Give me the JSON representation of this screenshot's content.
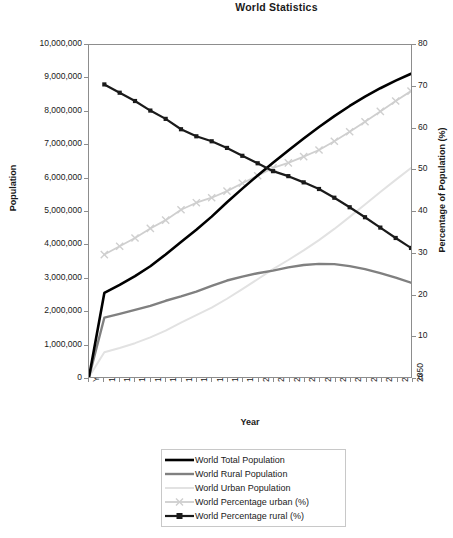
{
  "chart_title": "World Statistics",
  "axes": {
    "x_title": "Year",
    "y_left_title": "Population",
    "y_right_title": "Percentage of Population (%)",
    "y_left_ticks": [
      "10,000,000",
      "9,000,000",
      "8,000,000",
      "7,000,000",
      "6,000,000",
      "5,000,000",
      "4,000,000",
      "3,000,000",
      "2,000,000",
      "1,000,000",
      "0"
    ],
    "y_right_ticks": [
      "80",
      "70",
      "60",
      "50",
      "40",
      "30",
      "20",
      "10",
      "0"
    ],
    "x_ticks": [
      "Year",
      "1950",
      "1955",
      "1960",
      "1965",
      "1970",
      "1975",
      "1980",
      "1985",
      "1990",
      "1995",
      "2000",
      "2005",
      "2010",
      "2015",
      "2020",
      "2025",
      "2030",
      "2035",
      "2040",
      "2045",
      "2050"
    ]
  },
  "legend": {
    "items": [
      {
        "label": "World Total Population",
        "color": "#000000",
        "marker": "none",
        "width": 2.6
      },
      {
        "label": "World Rural Population",
        "color": "#808080",
        "marker": "none",
        "width": 2.4
      },
      {
        "label": "World Urban Population",
        "color": "#e2e2e2",
        "marker": "none",
        "width": 2.0
      },
      {
        "label": "World Percentage urban (%)",
        "color": "#cfcfcf",
        "marker": "cross",
        "width": 1.8
      },
      {
        "label": "World Percentage rural (%)",
        "color": "#1a1a1a",
        "marker": "square",
        "width": 2.2
      }
    ]
  },
  "chart_data": {
    "type": "line",
    "title": "World Statistics",
    "xlabel": "Year",
    "ylabel": "Population",
    "y2label": "Percentage of Population (%)",
    "ylim": [
      0,
      10000000
    ],
    "y2lim": [
      0,
      80
    ],
    "grid": false,
    "legend_position": "bottom",
    "categories": [
      "Year",
      "1950",
      "1955",
      "1960",
      "1965",
      "1970",
      "1975",
      "1980",
      "1985",
      "1990",
      "1995",
      "2000",
      "2005",
      "2010",
      "2015",
      "2020",
      "2025",
      "2030",
      "2035",
      "2040",
      "2045",
      "2050"
    ],
    "series": [
      {
        "name": "World Total Population",
        "axis": "left",
        "units": "thousands",
        "color": "#000000",
        "values": [
          0,
          2532229,
          2773019,
          3038413,
          3334874,
          3692492,
          4068109,
          4434682,
          4830979,
          5263593,
          5674380,
          6070581,
          6456156,
          6825170,
          7185932,
          7531142,
          7858608,
          8163346,
          8443180,
          8697815,
          8928040,
          9133858
        ]
      },
      {
        "name": "World Rural Population",
        "axis": "left",
        "units": "thousands",
        "color": "#808080",
        "values": [
          0,
          1785801,
          1899741,
          2020213,
          2142256,
          2296430,
          2429155,
          2573269,
          2742137,
          2906561,
          3025127,
          3125837,
          3204967,
          3301028,
          3372929,
          3409103,
          3398224,
          3340823,
          3249292,
          3127345,
          2991004,
          2840989
        ]
      },
      {
        "name": "World Urban Population",
        "axis": "left",
        "units": "thousands",
        "color": "#e2e2e2",
        "values": [
          0,
          746428,
          873278,
          1018200,
          1192618,
          1396062,
          1638954,
          1861413,
          2088842,
          2357032,
          2649253,
          2944744,
          3251189,
          3524142,
          3813003,
          4122039,
          4460384,
          4822523,
          5193888,
          5570470,
          5937036,
          6292869
        ]
      },
      {
        "name": "World Percentage urban (%)",
        "axis": "right",
        "units": "%",
        "color": "#cfcfcf",
        "values": [
          null,
          29.5,
          31.5,
          33.5,
          35.8,
          37.8,
          40.3,
          42.0,
          43.2,
          44.8,
          46.7,
          48.5,
          50.4,
          51.6,
          53.1,
          54.7,
          56.8,
          59.1,
          61.5,
          64.0,
          66.5,
          68.9
        ]
      },
      {
        "name": "World Percentage rural (%)",
        "axis": "right",
        "units": "%",
        "color": "#1a1a1a",
        "values": [
          null,
          70.5,
          68.5,
          66.5,
          64.2,
          62.2,
          59.7,
          58.0,
          56.8,
          55.2,
          53.3,
          51.5,
          49.6,
          48.4,
          46.9,
          45.3,
          43.2,
          40.9,
          38.5,
          36.0,
          33.5,
          31.1
        ]
      }
    ]
  }
}
